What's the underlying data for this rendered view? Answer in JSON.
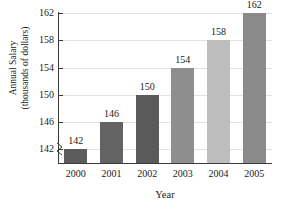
{
  "chart_data": {
    "type": "bar",
    "title": "",
    "xlabel": "Year",
    "ylabel": "Annual Salary (thousands of dollars)",
    "ylabel_line1": "Annual Salary",
    "ylabel_line2": "(thousands of dollars)",
    "categories": [
      "2000",
      "2001",
      "2002",
      "2003",
      "2004",
      "2005"
    ],
    "values": [
      142,
      146,
      150,
      154,
      158,
      162
    ],
    "value_labels": [
      "142",
      "146",
      "150",
      "154",
      "158",
      "162"
    ],
    "bar_colors": [
      "#5c5c5c",
      "#636363",
      "#5a5a5a",
      "#8e8e8e",
      "#bdbdbd",
      "#8a8a8a"
    ],
    "yticks": [
      142,
      146,
      150,
      154,
      158,
      162
    ],
    "ytick_labels": [
      "142",
      "146",
      "150",
      "154",
      "158",
      "162"
    ],
    "ylim": [
      140,
      162
    ],
    "axis_break": true,
    "grid": true,
    "grid_axis": "y",
    "legend": false,
    "axis_color": "#3b3b3b",
    "grid_color": "#e2e2e2",
    "text_color": "#1a1a1a",
    "background": "#ffffff"
  }
}
